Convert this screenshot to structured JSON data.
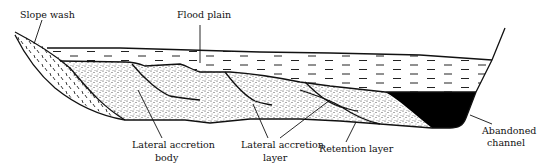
{
  "diagram": {
    "type": "geological cross-section",
    "labels": {
      "slope_wash": "Slope wash",
      "flood_plain": "Flood plain",
      "lateral_accretion_body_line1": "Lateral accretion",
      "lateral_accretion_body_line2": "body",
      "lateral_accretion_layer_line1": "Lateral accretion",
      "lateral_accretion_layer_line2": "layer",
      "retention_layer": "Retention layer",
      "abandoned_channel_line1": "Abandoned",
      "abandoned_channel_line2": "channel"
    },
    "colors": {
      "ink": "#111111",
      "background": "#ffffff",
      "abandoned_channel_fill": "#000000"
    }
  }
}
